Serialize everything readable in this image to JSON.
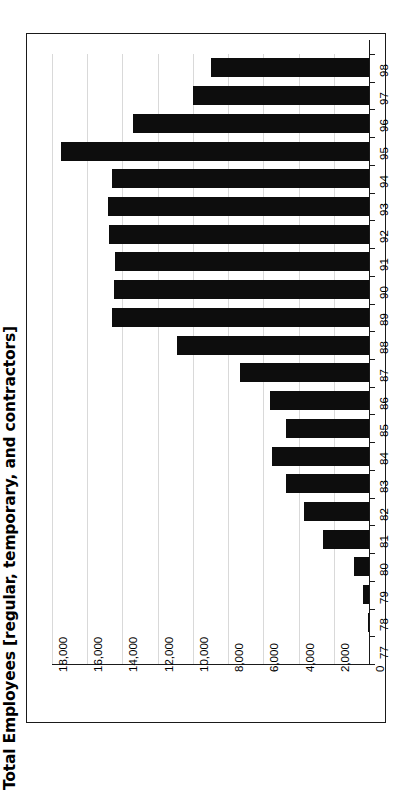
{
  "chart_data": {
    "type": "bar",
    "orientation": "horizontal-rotated",
    "title": "Total Employees [regular, temporary, and  contractors]",
    "xlabel": "",
    "ylabel": "",
    "grid": true,
    "legend": "none",
    "categories": [
      "77",
      "78",
      "79",
      "80",
      "81",
      "82",
      "83",
      "84",
      "85",
      "86",
      "87",
      "88",
      "89",
      "90",
      "91",
      "92",
      "93",
      "94",
      "95",
      "96",
      "97",
      "98"
    ],
    "values": [
      0,
      60,
      350,
      850,
      2600,
      3700,
      4700,
      5500,
      4700,
      5600,
      7300,
      10900,
      14600,
      14500,
      14400,
      14750,
      14800,
      14600,
      17500,
      13400,
      10000,
      9000
    ],
    "value_axis_ticks": [
      "0",
      "2,000",
      "4,000",
      "6,000",
      "8,000",
      "10,000",
      "12,000",
      "14,000",
      "16,000",
      "18,000"
    ],
    "value_axis_tick_values": [
      0,
      2000,
      4000,
      6000,
      8000,
      10000,
      12000,
      14000,
      16000,
      18000
    ],
    "ylim": [
      0,
      18000
    ],
    "bar_color": "#0d0d0d",
    "grid_color": "#d9d9d9",
    "axis_color": "#1a1a1a",
    "background": "#ffffff"
  },
  "figure": {
    "title": "Total Employees [regular, temporary, and  contractors]"
  }
}
